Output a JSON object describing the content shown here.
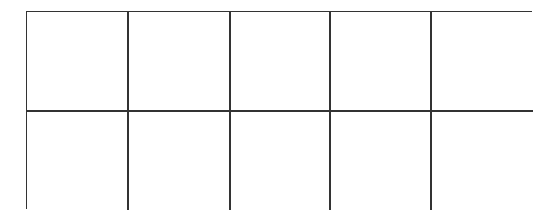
{
  "diagram": {
    "type": "grid",
    "rows": 2,
    "columns": 5,
    "line_color": "#333333",
    "cells": [
      [
        "",
        "",
        "",
        "",
        ""
      ],
      [
        "",
        "",
        "",
        "",
        ""
      ]
    ]
  }
}
